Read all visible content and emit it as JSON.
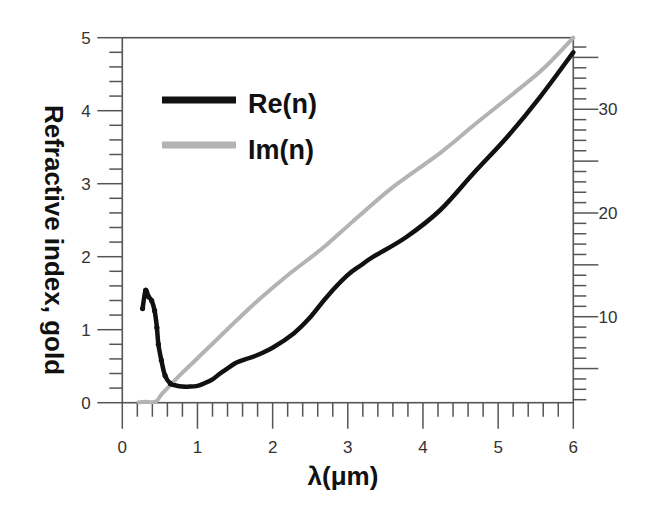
{
  "chart_data": {
    "type": "line",
    "title": "",
    "xlabel": "λ(μm)",
    "ylabel": "Refractive index, gold",
    "y2label": "",
    "xlim": [
      0,
      6
    ],
    "ylim": [
      0,
      5
    ],
    "y2lim": [
      1.71,
      36.9
    ],
    "x_ticks": [
      "0",
      "1",
      "2",
      "3",
      "4",
      "5",
      "6"
    ],
    "x_minor_step": 0.2,
    "y_ticks": [
      "0",
      "1",
      "2",
      "3",
      "4",
      "5"
    ],
    "y_minor_step": 0.2,
    "y2_ticks": [
      "10",
      "20",
      "30"
    ],
    "y2_major_step": 5,
    "y2_minor_step": 1,
    "grid": false,
    "legend_position": "upper-left",
    "series": [
      {
        "name": "Re(n)",
        "axis": "left",
        "color": "#111111",
        "markers": "dots at short wavelengths",
        "x": [
          0.27,
          0.31,
          0.35,
          0.39,
          0.43,
          0.46,
          0.48,
          0.52,
          0.57,
          0.64,
          0.7,
          0.8,
          0.9,
          1.0,
          1.08,
          1.2,
          1.3,
          1.4,
          1.52,
          1.65,
          1.79,
          2.01,
          2.28,
          2.5,
          2.72,
          2.99,
          3.17,
          3.34,
          3.78,
          4.23,
          4.67,
          5.12,
          5.56,
          6.0
        ],
        "values": [
          1.29,
          1.54,
          1.45,
          1.4,
          1.26,
          1.03,
          0.8,
          0.58,
          0.37,
          0.26,
          0.24,
          0.22,
          0.22,
          0.23,
          0.26,
          0.32,
          0.4,
          0.47,
          0.55,
          0.6,
          0.65,
          0.76,
          0.95,
          1.17,
          1.45,
          1.74,
          1.88,
          2.0,
          2.27,
          2.64,
          3.14,
          3.64,
          4.19,
          4.8
        ],
        "marker_count": 10
      },
      {
        "name": "Im(n)",
        "axis": "right",
        "color": "#b3b3b3",
        "x": [
          0.22,
          0.3,
          0.4,
          0.46,
          0.52,
          0.61,
          0.8,
          1.0,
          1.2,
          1.5,
          1.83,
          2.2,
          2.63,
          2.89,
          3.16,
          3.6,
          4.23,
          4.7,
          5.2,
          5.6,
          6.0
        ],
        "values": [
          1.75,
          1.8,
          1.75,
          1.9,
          2.5,
          3.19,
          4.6,
          6.0,
          7.4,
          9.5,
          11.73,
          14.0,
          16.4,
          18.04,
          19.78,
          22.5,
          25.8,
          28.6,
          31.5,
          33.9,
          36.9
        ]
      }
    ]
  },
  "legend": {
    "items": [
      {
        "label": "Re(n)",
        "color": "#111111"
      },
      {
        "label": "Im(n)",
        "color": "#b3b3b3"
      }
    ]
  },
  "axes": {
    "x_title": "λ(μm)",
    "y_title": "Refractive index, gold"
  }
}
